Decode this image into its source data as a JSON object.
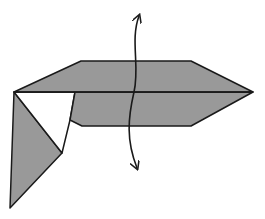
{
  "diagram": {
    "type": "origami-step",
    "colors": {
      "paper_fill": "#999999",
      "paper_white": "#ffffff",
      "stroke": "#1a1a1a",
      "background": "#ffffff"
    },
    "shapes": {
      "upper_flap": "14,92 81,61 191,61 253,92",
      "lower_flap": "75,92 253,92 191,126 82,126 70,120",
      "white_gap": "14,92 75,92 70,120 62,153",
      "left_point": "14,92 62,153 10,208",
      "center_crease": "14,92 253,92"
    },
    "arrow": {
      "kind": "double-headed-curved",
      "path": "M 137 168 C 126 140, 128 118, 134 92 C 140 66, 130 40, 139 16",
      "meaning": "fold in half / turn over along vertical axis"
    }
  }
}
